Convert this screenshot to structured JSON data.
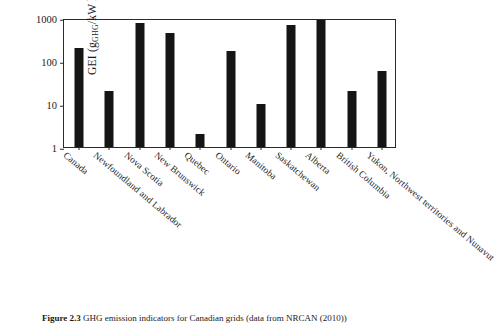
{
  "figure": {
    "caption_label": "Figure 2.3",
    "caption_text": "GHG emission indicators for Canadian grids (data from NRCAN (2010))"
  },
  "chart_data": {
    "type": "bar",
    "title": "",
    "xlabel": "",
    "ylabel": "GEI (gGHG/kW h)",
    "ylabel_main": "GEI (g",
    "ylabel_sub": "GHG",
    "ylabel_tail": "/kW h)",
    "yscale": "log",
    "ylim": [
      1,
      1000
    ],
    "yticks": [
      1,
      10,
      100,
      1000
    ],
    "ytick_labels": [
      "1",
      "10",
      "100",
      "1000"
    ],
    "grid": false,
    "legend": "none",
    "bar_color": "#151515",
    "categories": [
      "Canada",
      "Newfoundland and Labrador",
      "Nova Scotia",
      "New Brunswick",
      "Quebec",
      "Ontario",
      "Manitoba",
      "Saskatchewan",
      "Alberta",
      "British Columbia",
      "Yukon, Northwest territories and Nunavut"
    ],
    "values": [
      200,
      20,
      780,
      450,
      2,
      170,
      10,
      700,
      880,
      20,
      60
    ]
  }
}
